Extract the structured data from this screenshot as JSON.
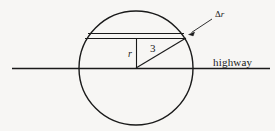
{
  "figure": {
    "background_color": "#f7f6f4",
    "stroke_color": "#1a1a1a",
    "labels": {
      "highway": "highway",
      "delta_symbol": "Δ",
      "delta_r_variable": "r",
      "radius": "r",
      "distance": "3"
    },
    "geometry": {
      "circle": {
        "cx": 136,
        "cy": 68,
        "r": 57
      },
      "highway_line": {
        "x1": 12,
        "y1": 68,
        "x2": 270,
        "y2": 68
      },
      "upper_chord": {
        "x1": 88,
        "y1": 33,
        "x2": 184,
        "y2": 33
      },
      "lower_chord": {
        "x1": 85,
        "y1": 38,
        "x2": 186,
        "y2": 38
      },
      "radius_segment": {
        "x1": 136,
        "y1": 38,
        "x2": 136,
        "y2": 68
      },
      "hypotenuse_segment": {
        "x1": 136,
        "y1": 68,
        "x2": 186,
        "y2": 38
      },
      "leader_arrow": {
        "x1": 213,
        "y1": 19,
        "x2": 189,
        "y2": 34
      }
    }
  }
}
